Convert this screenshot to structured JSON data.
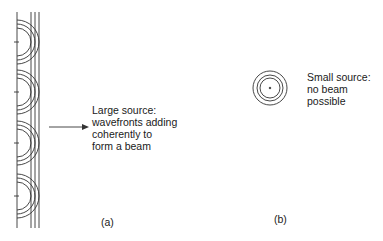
{
  "panel_a": {
    "caption": "(a)",
    "label": "Large source:\nwavefronts adding\ncoherently to\nform a beam",
    "source_plane_x": 17,
    "sources_y": [
      42,
      92,
      143,
      196
    ],
    "wavefront_radii": [
      14,
      18,
      22
    ],
    "envelope_x": [
      33,
      37,
      41
    ]
  },
  "panel_b": {
    "caption": "(b)",
    "label": "Small source:\nno beam\npossible",
    "center": [
      270,
      88
    ],
    "wavefront_radii": [
      10,
      13,
      17
    ]
  },
  "colors": {
    "line": "#333333",
    "background": "#ffffff"
  }
}
